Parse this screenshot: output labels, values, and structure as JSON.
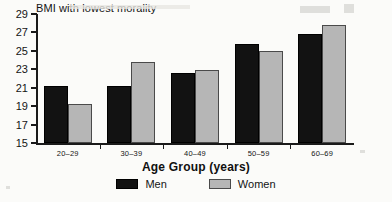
{
  "chart_data": {
    "type": "bar",
    "title": "BMI with lowest morality",
    "xlabel": "Age Group (years)",
    "ylabel": "",
    "categories": [
      "20–29",
      "30–39",
      "40–49",
      "50–59",
      "60–69"
    ],
    "series": [
      {
        "name": "Men",
        "color": "#121212",
        "values": [
          21.2,
          21.2,
          22.6,
          25.8,
          26.8
        ]
      },
      {
        "name": "Women",
        "color": "#b6b6b6",
        "values": [
          19.2,
          23.8,
          22.9,
          25.0,
          27.8
        ]
      }
    ],
    "ylim": [
      15,
      29
    ],
    "yticks": [
      15,
      17,
      19,
      21,
      23,
      25,
      27,
      29
    ],
    "ytick_labels": [
      "15",
      "17",
      "19",
      "21",
      "23",
      "25",
      "27",
      "29"
    ],
    "grid": false,
    "legend": {
      "position": "bottom",
      "entries": [
        "Men",
        "Women"
      ]
    }
  }
}
